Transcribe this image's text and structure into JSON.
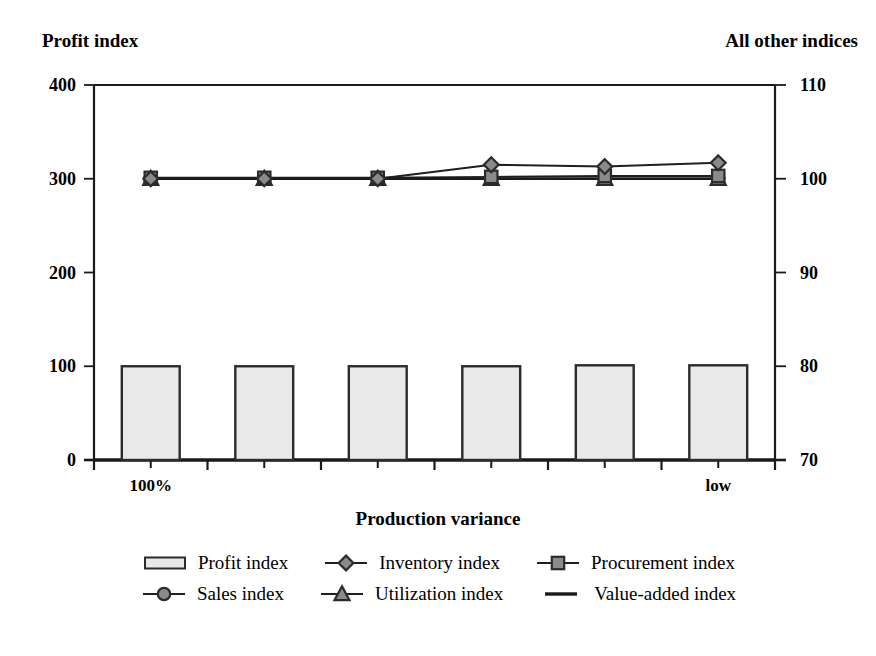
{
  "chart_data": {
    "type": "bar",
    "title": "",
    "xlabel": "Production variance",
    "left_axis_title": "Profit index",
    "right_axis_title": "All other indices",
    "grid": false,
    "legend_position": "bottom",
    "categories": [
      "100%",
      "",
      "",
      "",
      "",
      "low"
    ],
    "tick_labels_x": [
      "100%",
      "low"
    ],
    "left_axis": {
      "label": "Profit index",
      "ylim": [
        0,
        400
      ],
      "ticks": [
        0,
        100,
        200,
        300,
        400
      ],
      "tick_labels": [
        "0",
        "100",
        "200",
        "300",
        "400"
      ]
    },
    "right_axis": {
      "label": "All other indices",
      "ylim": [
        70,
        110
      ],
      "ticks": [
        70,
        80,
        90,
        100,
        110
      ],
      "tick_labels": [
        "70",
        "80",
        "90",
        "100",
        "110"
      ]
    },
    "series": [
      {
        "name": "Profit index",
        "axis": "left",
        "type": "bar",
        "marker": "rect",
        "fill": "#e9e9e9",
        "stroke": "#2b2b2b",
        "values": [
          100,
          100,
          100,
          100,
          101,
          101
        ]
      },
      {
        "name": "Inventory index",
        "axis": "right",
        "type": "line",
        "marker": "diamond",
        "fill": "#8a8a8a",
        "stroke": "#2b2b2b",
        "values": [
          100.0,
          100.0,
          100.0,
          101.5,
          101.3,
          101.7
        ]
      },
      {
        "name": "Procurement index",
        "axis": "right",
        "type": "line",
        "marker": "square",
        "fill": "#8a8a8a",
        "stroke": "#2b2b2b",
        "values": [
          100.1,
          100.1,
          100.1,
          100.2,
          100.3,
          100.3
        ]
      },
      {
        "name": "Sales index",
        "axis": "right",
        "type": "line",
        "marker": "circle",
        "fill": "#8a8a8a",
        "stroke": "#2b2b2b",
        "values": [
          100.0,
          100.0,
          100.0,
          100.0,
          100.0,
          100.0
        ]
      },
      {
        "name": "Utilization index",
        "axis": "right",
        "type": "line",
        "marker": "triangle",
        "fill": "#8a8a8a",
        "stroke": "#2b2b2b",
        "values": [
          100.0,
          100.0,
          100.0,
          100.0,
          100.0,
          100.0
        ]
      },
      {
        "name": "Value-added index",
        "axis": "right",
        "type": "line",
        "marker": "none",
        "fill": "#000000",
        "stroke": "#1a1a1a",
        "values": [
          100.0,
          100.0,
          100.0,
          100.0,
          100.0,
          100.0
        ]
      }
    ]
  },
  "legend": {
    "rows": [
      [
        {
          "label": "Profit index",
          "marker": "rect"
        },
        {
          "label": "Inventory index",
          "marker": "diamond"
        },
        {
          "label": "Procurement index",
          "marker": "square"
        }
      ],
      [
        {
          "label": "Sales index",
          "marker": "circle"
        },
        {
          "label": "Utilization index",
          "marker": "triangle"
        },
        {
          "label": "Value-added index",
          "marker": "line"
        }
      ]
    ]
  },
  "colors": {
    "axis": "#1a1a1a",
    "bar_fill": "#e9e9e9",
    "bar_stroke": "#2b2b2b",
    "marker_fill": "#8a8a8a",
    "marker_stroke": "#2b2b2b",
    "line": "#1f1f1f",
    "text": "#000000"
  }
}
